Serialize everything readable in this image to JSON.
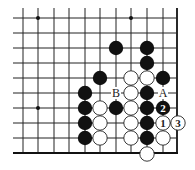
{
  "diagram": {
    "type": "go-board-fragment",
    "grid": {
      "xs": [
        23,
        38,
        54,
        69,
        85,
        100,
        116,
        131,
        147,
        163,
        178
      ],
      "ys": [
        18,
        33,
        48,
        63,
        78,
        93,
        108,
        123,
        138,
        153
      ],
      "right_edge": true,
      "bottom_edge": true
    },
    "star_points": [
      [
        1,
        0
      ],
      [
        7,
        0
      ],
      [
        1,
        6
      ]
    ],
    "stones": [
      {
        "c": 6,
        "r": 2,
        "color": "black"
      },
      {
        "c": 8,
        "r": 2,
        "color": "black"
      },
      {
        "c": 8,
        "r": 3,
        "color": "black"
      },
      {
        "c": 5,
        "r": 4,
        "color": "black"
      },
      {
        "c": 7,
        "r": 4,
        "color": "white"
      },
      {
        "c": 8,
        "r": 4,
        "color": "white"
      },
      {
        "c": 9,
        "r": 4,
        "color": "black"
      },
      {
        "c": 4,
        "r": 5,
        "color": "black"
      },
      {
        "c": 7,
        "r": 5,
        "color": "white"
      },
      {
        "c": 8,
        "r": 5,
        "color": "black"
      },
      {
        "c": 4,
        "r": 6,
        "color": "black"
      },
      {
        "c": 5,
        "r": 6,
        "color": "white"
      },
      {
        "c": 6,
        "r": 6,
        "color": "black"
      },
      {
        "c": 7,
        "r": 6,
        "color": "white"
      },
      {
        "c": 8,
        "r": 6,
        "color": "black"
      },
      {
        "c": 9,
        "r": 6,
        "color": "black",
        "label": "2"
      },
      {
        "c": 4,
        "r": 7,
        "color": "black"
      },
      {
        "c": 5,
        "r": 7,
        "color": "white"
      },
      {
        "c": 7,
        "r": 7,
        "color": "white"
      },
      {
        "c": 8,
        "r": 7,
        "color": "black"
      },
      {
        "c": 9,
        "r": 7,
        "color": "white",
        "label": "1"
      },
      {
        "c": 10,
        "r": 7,
        "color": "white",
        "label": "3"
      },
      {
        "c": 4,
        "r": 8,
        "color": "black"
      },
      {
        "c": 5,
        "r": 8,
        "color": "white"
      },
      {
        "c": 7,
        "r": 8,
        "color": "white"
      },
      {
        "c": 8,
        "r": 8,
        "color": "black"
      },
      {
        "c": 9,
        "r": 8,
        "color": "white"
      },
      {
        "c": 8,
        "r": 9,
        "color": "white"
      }
    ],
    "markers": [
      {
        "c": 6,
        "r": 5,
        "text": "B"
      },
      {
        "c": 9,
        "r": 5,
        "text": "A"
      }
    ]
  }
}
